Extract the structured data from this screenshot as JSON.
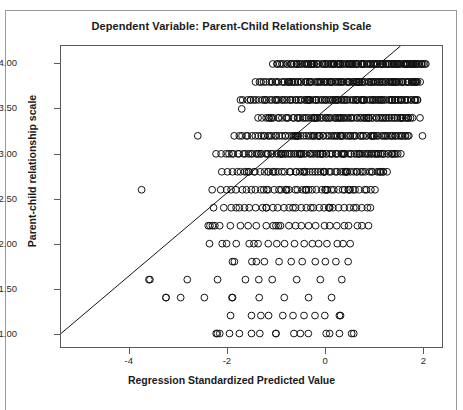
{
  "chart_data": {
    "type": "scatter",
    "title": "Dependent Variable: Parent-Child Relationship Scale",
    "xlabel": "Regression Standardized Predicted Value",
    "ylabel": "Parent-child relationship scale",
    "xlim": [
      -5.4,
      2.4
    ],
    "ylim": [
      0.85,
      4.2
    ],
    "xticks": [
      -4,
      -2,
      0,
      2
    ],
    "xticklabels": [
      "-4",
      "-2",
      "0",
      "2"
    ],
    "yticks": [
      1.0,
      1.5,
      2.0,
      2.5,
      3.0,
      3.5,
      4.0
    ],
    "yticklabels": [
      "1.00",
      "1.50",
      "2.00",
      "2.50",
      "3.00",
      "3.50",
      "4.00"
    ],
    "grid": false,
    "legend": null,
    "marker": "open-circle",
    "marker_size_px": 7,
    "reference_line": {
      "type": "identity-fit-line",
      "x0": -5.4,
      "y0": 1.0,
      "x1": 1.55,
      "y1": 4.2,
      "description": "diagonal line from lower-left corner rising through upper-right, exits top of plot"
    },
    "series": [
      {
        "name": "cases",
        "points": [
          [
            -3.75,
            2.6
          ],
          [
            -3.6,
            1.6
          ],
          [
            -3.25,
            1.4
          ],
          [
            -2.95,
            1.4
          ],
          [
            -2.6,
            3.2
          ],
          [
            -2.35,
            2.2
          ],
          [
            -2.3,
            2.2
          ],
          [
            -2.25,
            2.2
          ],
          [
            -2.2,
            1.0
          ],
          [
            -2.15,
            1.0
          ],
          [
            -2.1,
            2.0
          ],
          [
            -1.95,
            1.0
          ],
          [
            -1.85,
            1.8
          ],
          [
            -1.75,
            2.4
          ],
          [
            -1.7,
            3.5
          ],
          [
            -1.6,
            2.8
          ],
          [
            -1.55,
            2.8
          ],
          [
            -1.45,
            2.0
          ],
          [
            -1.4,
            1.8
          ],
          [
            -1.35,
            1.6
          ],
          [
            -1.3,
            3.0
          ],
          [
            -1.25,
            2.6
          ],
          [
            -1.2,
            2.4
          ],
          [
            -1.15,
            3.4
          ],
          [
            -1.1,
            3.4
          ],
          [
            -1.05,
            2.8
          ],
          [
            -1.0,
            2.2
          ],
          [
            -0.95,
            2.2
          ],
          [
            -0.9,
            3.0
          ],
          [
            -0.88,
            3.0
          ],
          [
            -0.85,
            3.0
          ],
          [
            -0.8,
            2.6
          ],
          [
            -0.78,
            2.6
          ],
          [
            -0.75,
            3.8
          ],
          [
            -0.72,
            3.8
          ],
          [
            -0.7,
            4.0
          ],
          [
            -0.65,
            2.4
          ],
          [
            -0.6,
            3.2
          ],
          [
            -0.58,
            3.2
          ],
          [
            -0.55,
            3.2
          ],
          [
            -0.52,
            3.0
          ],
          [
            -0.5,
            3.0
          ],
          [
            -0.48,
            3.0
          ],
          [
            -0.45,
            2.8
          ],
          [
            -0.42,
            2.8
          ],
          [
            -0.4,
            2.6
          ],
          [
            -0.38,
            2.6
          ],
          [
            -0.35,
            3.6
          ],
          [
            -0.33,
            3.6
          ],
          [
            -0.3,
            3.6
          ],
          [
            -0.28,
            4.0
          ],
          [
            -0.25,
            4.0
          ],
          [
            -0.22,
            3.4
          ],
          [
            -0.2,
            3.4
          ],
          [
            -0.18,
            3.4
          ],
          [
            -0.15,
            3.2
          ],
          [
            -0.12,
            3.2
          ],
          [
            -0.1,
            3.0
          ],
          [
            -0.08,
            3.0
          ],
          [
            -0.05,
            3.0
          ],
          [
            -0.02,
            2.8
          ],
          [
            0.0,
            2.8
          ],
          [
            0.02,
            2.6
          ],
          [
            0.05,
            2.6
          ],
          [
            0.08,
            2.4
          ],
          [
            0.1,
            2.4
          ],
          [
            0.12,
            3.8
          ],
          [
            0.15,
            3.8
          ],
          [
            0.18,
            4.0
          ],
          [
            0.2,
            4.0
          ],
          [
            0.22,
            3.6
          ],
          [
            0.25,
            3.6
          ],
          [
            0.28,
            3.4
          ],
          [
            0.3,
            3.4
          ],
          [
            0.32,
            3.2
          ],
          [
            0.35,
            3.2
          ],
          [
            0.38,
            3.0
          ],
          [
            0.4,
            3.0
          ],
          [
            0.42,
            2.8
          ],
          [
            0.45,
            2.8
          ],
          [
            0.48,
            2.6
          ],
          [
            0.5,
            2.6
          ],
          [
            0.55,
            4.0
          ],
          [
            0.6,
            4.0
          ],
          [
            0.65,
            3.8
          ],
          [
            0.7,
            3.8
          ],
          [
            0.75,
            3.6
          ],
          [
            0.8,
            3.6
          ],
          [
            0.85,
            3.4
          ],
          [
            0.9,
            3.4
          ],
          [
            0.95,
            3.2
          ],
          [
            1.0,
            3.2
          ],
          [
            1.05,
            3.0
          ],
          [
            1.1,
            3.0
          ],
          [
            1.15,
            2.8
          ],
          [
            1.2,
            2.8
          ],
          [
            1.25,
            4.0
          ],
          [
            1.3,
            4.0
          ],
          [
            1.35,
            3.8
          ],
          [
            1.4,
            3.8
          ],
          [
            1.45,
            3.6
          ],
          [
            1.5,
            3.6
          ],
          [
            1.55,
            3.4
          ],
          [
            1.6,
            3.4
          ],
          [
            1.65,
            4.0
          ],
          [
            1.7,
            4.0
          ],
          [
            1.75,
            4.0
          ],
          [
            1.8,
            4.0
          ],
          [
            1.85,
            3.8
          ],
          [
            1.9,
            3.6
          ],
          [
            1.95,
            3.4
          ],
          [
            2.0,
            3.2
          ],
          [
            -1.9,
            1.4
          ],
          [
            -1.5,
            1.2
          ],
          [
            -1.15,
            1.2
          ],
          [
            -0.65,
            1.2
          ],
          [
            -0.2,
            1.2
          ],
          [
            0.3,
            1.2
          ],
          [
            -1.5,
            1.0
          ],
          [
            -1.0,
            1.0
          ],
          [
            -0.5,
            1.0
          ],
          [
            0.1,
            1.0
          ],
          [
            0.55,
            1.0
          ]
        ]
      }
    ],
    "density_bands": [
      {
        "y": 4.0,
        "x_start": -1.05,
        "x_end": 2.05,
        "n": 120
      },
      {
        "y": 3.8,
        "x_start": -1.4,
        "x_end": 1.95,
        "n": 110
      },
      {
        "y": 3.6,
        "x_start": -1.75,
        "x_end": 1.9,
        "n": 105
      },
      {
        "y": 3.4,
        "x_start": -1.35,
        "x_end": 1.8,
        "n": 80
      },
      {
        "y": 3.2,
        "x_start": -1.85,
        "x_end": 1.75,
        "n": 85
      },
      {
        "y": 3.0,
        "x_start": -2.2,
        "x_end": 1.55,
        "n": 90
      },
      {
        "y": 2.8,
        "x_start": -2.1,
        "x_end": 1.25,
        "n": 55
      },
      {
        "y": 2.6,
        "x_start": -2.3,
        "x_end": 1.0,
        "n": 40
      },
      {
        "y": 2.4,
        "x_start": -2.3,
        "x_end": 0.95,
        "n": 30
      },
      {
        "y": 2.2,
        "x_start": -2.4,
        "x_end": 0.9,
        "n": 22
      },
      {
        "y": 2.0,
        "x_start": -2.35,
        "x_end": 0.55,
        "n": 16
      },
      {
        "y": 1.8,
        "x_start": -1.9,
        "x_end": 0.45,
        "n": 10
      },
      {
        "y": 1.6,
        "x_start": -3.6,
        "x_end": 0.35,
        "n": 8
      },
      {
        "y": 1.4,
        "x_start": -3.25,
        "x_end": 0.15,
        "n": 7
      },
      {
        "y": 1.2,
        "x_start": -1.9,
        "x_end": 0.35,
        "n": 6
      },
      {
        "y": 1.0,
        "x_start": -2.25,
        "x_end": 0.6,
        "n": 9
      }
    ]
  },
  "accent_colors": {
    "marker_stroke": "#111111",
    "axis": "#5a5a5a",
    "frame": "#9a9a9a",
    "text": "#1a1a1a"
  }
}
